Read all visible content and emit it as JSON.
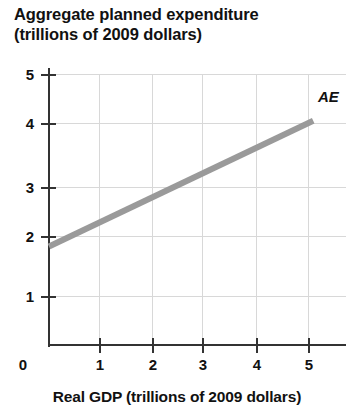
{
  "chart_data": {
    "type": "line",
    "title": "Aggregate planned expenditure (trillions of 2009 dollars)",
    "title_lines": [
      "Aggregate planned expenditure",
      "(trillions of 2009 dollars)"
    ],
    "xlabel": "Real GDP (trillions of 2009 dollars)",
    "ylabel": "Aggregate planned expenditure (trillions of 2009 dollars)",
    "xlim": [
      0,
      5.7
    ],
    "ylim": [
      0,
      5.5
    ],
    "xticks": [
      "1",
      "2",
      "3",
      "4",
      "5"
    ],
    "xtick_values": [
      1,
      2,
      3,
      4,
      5
    ],
    "yticks": [
      "1",
      "2",
      "3",
      "4",
      "5"
    ],
    "ytick_values": [
      1,
      2,
      3,
      4,
      5
    ],
    "origin_label": "0",
    "grid": true,
    "legend": "none",
    "line_color": "#9a9a9a",
    "axis_color": "#333333",
    "series": [
      {
        "name": "AE",
        "label": "AE",
        "x": [
          0.0,
          5.1
        ],
        "y": [
          2.0,
          4.55
        ],
        "intercept": 2.0,
        "slope": 0.5
      }
    ],
    "annotations": [
      {
        "text": "AE",
        "x": 5.25,
        "y": 4.7
      }
    ]
  }
}
